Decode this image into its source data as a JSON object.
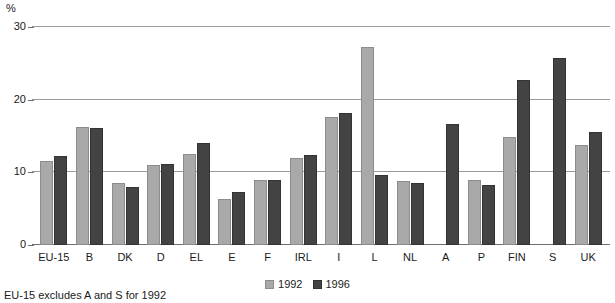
{
  "chart_data": {
    "type": "bar",
    "title": "",
    "xlabel": "",
    "ylabel": "%",
    "ylim": [
      0,
      30
    ],
    "yticks": [
      0,
      10,
      20,
      30
    ],
    "ytick_labels": [
      "0",
      "10",
      "20",
      "30"
    ],
    "grid": true,
    "legend_position": "bottom-center",
    "categories": [
      "EU-15",
      "B",
      "DK",
      "D",
      "EL",
      "E",
      "F",
      "IRL",
      "I",
      "L",
      "NL",
      "A",
      "P",
      "FIN",
      "S",
      "UK"
    ],
    "series": [
      {
        "name": "1992",
        "color": "#a9a9a9",
        "values": [
          11.5,
          16.2,
          8.5,
          11.0,
          12.5,
          6.4,
          8.9,
          12.0,
          17.6,
          27.2,
          8.8,
          null,
          8.9,
          14.8,
          null,
          13.7
        ]
      },
      {
        "name": "1996",
        "color": "#434343",
        "values": [
          12.3,
          16.1,
          8.0,
          11.2,
          14.0,
          7.3,
          9.0,
          12.4,
          18.2,
          9.6,
          8.5,
          16.6,
          8.3,
          22.7,
          25.8,
          15.5
        ]
      }
    ],
    "annotations": [
      "EU-15 excludes A and S for 1992"
    ]
  },
  "axis": {
    "unit_label": "%"
  },
  "legend": {
    "items": [
      {
        "label": "1992"
      },
      {
        "label": "1996"
      }
    ]
  },
  "footnote": {
    "text": "EU-15 excludes A and S for 1992"
  }
}
